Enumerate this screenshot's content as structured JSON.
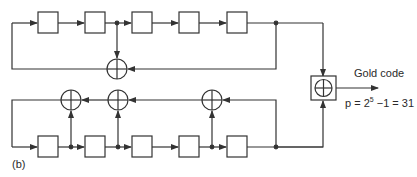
{
  "diagram": {
    "type": "gold-code-generator",
    "panel_label": "(b)",
    "output_label": "Gold code",
    "period_formula": {
      "prefix": "p = 2",
      "exponent": "5",
      "suffix": " −1 = 31"
    },
    "colors": {
      "stroke": "#333333",
      "background": "#ffffff"
    },
    "upper_lfsr": {
      "stages": 5,
      "xor_gates": 1,
      "taps_after_stage": [
        2,
        5
      ]
    },
    "lower_lfsr": {
      "stages": 5,
      "xor_gates": 3,
      "taps_after_stage": [
        1,
        2,
        4,
        5
      ]
    },
    "combiner": "modulo-2 adder (XOR)"
  }
}
